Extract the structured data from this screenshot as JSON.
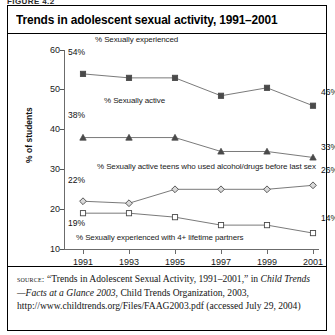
{
  "figure": {
    "header": "FIGURE 4.2",
    "title": "Trends in adolescent sexual activity, 1991–2001"
  },
  "source_note": {
    "label": "source:",
    "part1": " “Trends in Adolescent Sexual Activity, 1991–2001,” in ",
    "italic1": "Child Trends—Facts at a Glance 2003",
    "part2": ", Child Trends Organization, 2003, http://www.childtrends.org/Files/FAAG2003.pdf (accessed July 29, 2004)"
  },
  "chart_data": {
    "type": "line",
    "title": "Trends in adolescent sexual activity, 1991–2001",
    "xlabel": "",
    "ylabel": "% of students",
    "x": [
      1991,
      1993,
      1995,
      1997,
      1999,
      2001
    ],
    "xtick_labels": [
      "1991",
      "1993",
      "1995",
      "1997",
      "1999",
      "2001"
    ],
    "ytick_labels": [
      "60",
      "50",
      "40",
      "30",
      "20",
      "10"
    ],
    "yticks": [
      60,
      50,
      40,
      30,
      20,
      10
    ],
    "ylim": [
      10,
      60
    ],
    "grid": false,
    "legend_position": "inline-above-series",
    "series": [
      {
        "name": "% Sexually experienced",
        "marker": "filled-square",
        "values": [
          54,
          53,
          53,
          48.5,
          50.5,
          46
        ],
        "start_label": "54%",
        "end_label": "46%"
      },
      {
        "name": "% Sexually active",
        "marker": "filled-triangle",
        "values": [
          38,
          38,
          38,
          34.5,
          34.5,
          33
        ],
        "start_label": "38%",
        "end_label": "33%"
      },
      {
        "name": "% Sexually active teens who used alcohol/drugs before last sex",
        "marker": "open-diamond",
        "values": [
          22,
          21.5,
          25,
          25,
          25,
          26
        ],
        "start_label": "22%",
        "end_label": "26%"
      },
      {
        "name": "% Sexually experienced with 4+ lifetime partners",
        "marker": "open-square",
        "values": [
          19,
          19,
          18,
          16,
          16,
          14
        ],
        "start_label": "19%",
        "end_label": "14%"
      }
    ]
  }
}
